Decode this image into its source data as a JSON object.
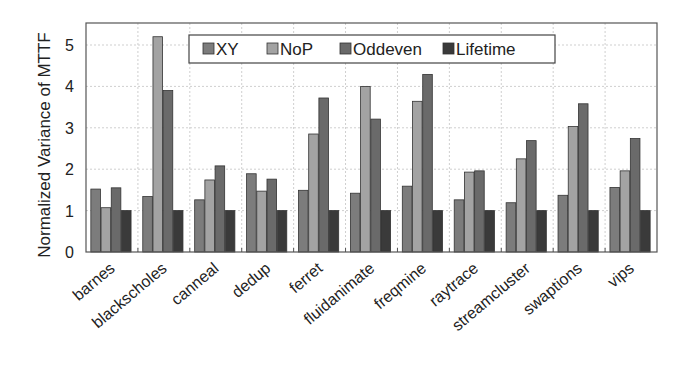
{
  "chart_data": {
    "type": "bar",
    "title": "",
    "xlabel": "",
    "ylabel": "Normalized Variance of MTTF",
    "ylim": [
      0,
      5.5
    ],
    "yticks": [
      0,
      1,
      2,
      3,
      4,
      5
    ],
    "grid": true,
    "legend_position": "top-inside",
    "categories": [
      "barnes",
      "blackscholes",
      "canneal",
      "dedup",
      "ferret",
      "fluidanimate",
      "freqmine",
      "raytrace",
      "streamcluster",
      "swaptions",
      "vips"
    ],
    "series": [
      {
        "name": "XY",
        "color": "#7c7c7c",
        "values": [
          1.52,
          1.34,
          1.26,
          1.89,
          1.49,
          1.42,
          1.59,
          1.26,
          1.19,
          1.37,
          1.56
        ]
      },
      {
        "name": "NoP",
        "color": "#a3a3a3",
        "values": [
          1.07,
          5.2,
          1.74,
          1.47,
          2.85,
          4.0,
          3.64,
          1.93,
          2.25,
          3.03,
          1.96
        ]
      },
      {
        "name": "Oddeven",
        "color": "#6a6a6a",
        "values": [
          1.55,
          3.9,
          2.08,
          1.76,
          3.72,
          3.21,
          4.29,
          1.96,
          2.69,
          3.58,
          2.74
        ]
      },
      {
        "name": "Lifetime",
        "color": "#3a3a3a",
        "values": [
          1.0,
          1.0,
          1.0,
          1.0,
          1.0,
          1.0,
          1.0,
          1.0,
          1.0,
          1.0,
          1.0
        ]
      }
    ]
  }
}
